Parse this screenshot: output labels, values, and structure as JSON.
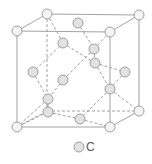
{
  "diagram": {
    "colors": {
      "line": "#8a8a8a",
      "atom_fill": "#e2e2e2",
      "atom_stroke": "#8a8a8a",
      "corner_fill": "#f4f4f4"
    },
    "corner_atoms": [
      {
        "x": 17,
        "y": 31
      },
      {
        "x": 110,
        "y": 32
      },
      {
        "x": 17,
        "y": 127
      },
      {
        "x": 110,
        "y": 127
      },
      {
        "x": 47,
        "y": 14
      },
      {
        "x": 139,
        "y": 15
      },
      {
        "x": 139,
        "y": 111
      }
    ],
    "inner_atoms": [
      {
        "x": 78,
        "y": 23
      },
      {
        "x": 63,
        "y": 43
      },
      {
        "x": 94,
        "y": 49
      },
      {
        "x": 95,
        "y": 63
      },
      {
        "x": 33,
        "y": 72
      },
      {
        "x": 63,
        "y": 80
      },
      {
        "x": 125,
        "y": 72
      },
      {
        "x": 110,
        "y": 89
      },
      {
        "x": 48,
        "y": 99
      },
      {
        "x": 48,
        "y": 112
      },
      {
        "x": 80,
        "y": 119
      }
    ]
  },
  "legend": {
    "symbol": "atom-circle",
    "label": "C"
  }
}
